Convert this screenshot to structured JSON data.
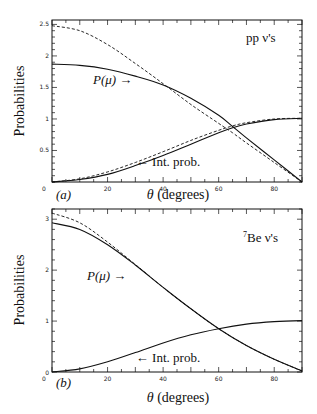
{
  "chart_data": [
    {
      "type": "line",
      "panel": "(a)",
      "title": "pp ν's",
      "xlabel": "θ (degrees)",
      "ylabel": "Probabilities",
      "xlim": [
        0,
        90
      ],
      "ylim": [
        0,
        2.57
      ],
      "xticks": [
        0,
        20,
        40,
        60,
        80
      ],
      "yticks": [
        0.5,
        1,
        1.5,
        2,
        2.5
      ],
      "x": [
        0,
        10,
        20,
        30,
        40,
        50,
        60,
        65,
        70,
        80,
        90
      ],
      "series": [
        {
          "name": "P(μ) solid",
          "style": "solid",
          "values": [
            1.87,
            1.85,
            1.79,
            1.68,
            1.54,
            1.33,
            1.06,
            0.88,
            0.7,
            0.35,
            0.0
          ]
        },
        {
          "name": "P(μ) dashed",
          "style": "dashed",
          "values": [
            2.48,
            2.4,
            2.18,
            1.88,
            1.56,
            1.23,
            0.93,
            0.78,
            0.62,
            0.31,
            0.0
          ]
        },
        {
          "name": "Int. prob. solid",
          "style": "solid",
          "values": [
            0.0,
            0.04,
            0.12,
            0.26,
            0.42,
            0.6,
            0.78,
            0.86,
            0.92,
            0.99,
            1.01
          ]
        },
        {
          "name": "Int. prob. dashed",
          "style": "dashed",
          "values": [
            0.0,
            0.05,
            0.16,
            0.31,
            0.48,
            0.66,
            0.82,
            0.89,
            0.94,
            1.0,
            1.01
          ]
        }
      ],
      "annotations": [
        "P(μ) →",
        "← Int. prob.",
        "pp ν's",
        "(a)"
      ]
    },
    {
      "type": "line",
      "panel": "(b)",
      "title": "7Be ν's",
      "xlabel": "θ (degrees)",
      "ylabel": "Probabilities",
      "xlim": [
        0,
        90
      ],
      "ylim": [
        0,
        3.2
      ],
      "xticks": [
        0,
        20,
        40,
        60,
        80
      ],
      "yticks": [
        0,
        1,
        2,
        3
      ],
      "x": [
        0,
        10,
        20,
        30,
        40,
        50,
        60,
        70,
        80,
        90
      ],
      "series": [
        {
          "name": "P(μ) solid",
          "style": "solid",
          "values": [
            2.93,
            2.8,
            2.5,
            2.1,
            1.66,
            1.24,
            0.85,
            0.52,
            0.25,
            0.02
          ]
        },
        {
          "name": "P(μ) dashed",
          "style": "dashed",
          "values": [
            3.12,
            2.93,
            2.55,
            2.11,
            1.66,
            1.24,
            0.85,
            0.52,
            0.25,
            0.02
          ]
        },
        {
          "name": "Int. prob. solid",
          "style": "solid",
          "values": [
            0.0,
            0.06,
            0.2,
            0.38,
            0.57,
            0.73,
            0.85,
            0.94,
            0.99,
            1.01
          ]
        }
      ],
      "annotations": [
        "P(μ) →",
        "← Int. prob.",
        "7Be ν's",
        "(b)"
      ]
    }
  ],
  "labels": {
    "ylabel": "Probabilities",
    "xlabel_theta": "θ",
    "xlabel_unit": "(degrees)",
    "panel_a": "(a)",
    "panel_b": "(b)",
    "pmu": "P(μ)",
    "arrow_right": "→",
    "int_prob": "← Int. prob.",
    "title_a": "pp  ν's",
    "title_b_sup": "7",
    "title_b": "Be  ν's"
  }
}
